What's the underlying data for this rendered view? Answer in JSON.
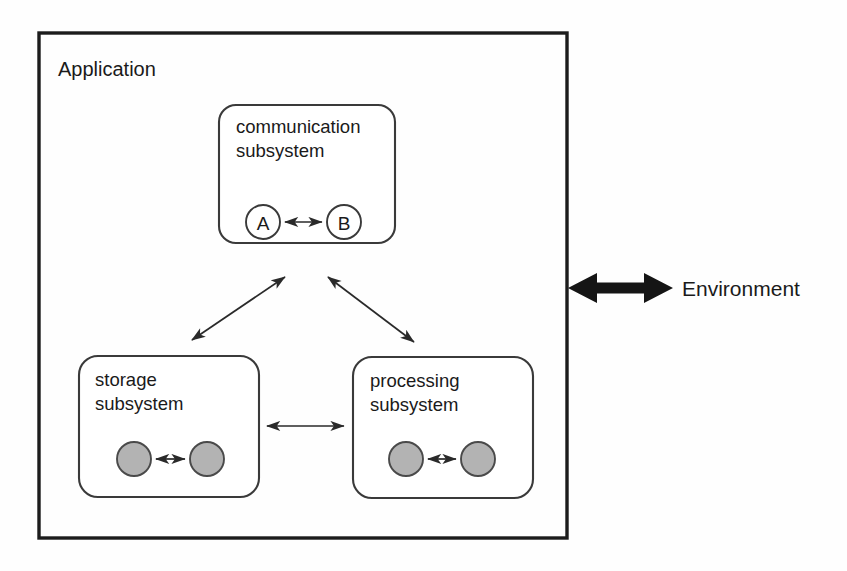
{
  "diagram": {
    "outer_container": {
      "label": "Application",
      "shape": "rectangle",
      "border_color": "#1c1c1c"
    },
    "external_label": "Environment",
    "external_connector": {
      "name": "environment-arrow",
      "style": "thick-double-headed",
      "color": "#151515"
    },
    "subsystems": [
      {
        "id": "communication",
        "label_line1": "communication",
        "label_line2": "subsystem",
        "nodes": [
          {
            "id": "node-a",
            "label": "A",
            "fill": "#ffffff"
          },
          {
            "id": "node-b",
            "label": "B",
            "fill": "#ffffff"
          }
        ],
        "internal_connector": "double-headed-arrow"
      },
      {
        "id": "storage",
        "label_line1": "storage",
        "label_line2": "subsystem",
        "nodes": [
          {
            "id": "storage-node-1",
            "label": "",
            "fill": "#b3b3b3"
          },
          {
            "id": "storage-node-2",
            "label": "",
            "fill": "#b3b3b3"
          }
        ],
        "internal_connector": "double-headed-arrow"
      },
      {
        "id": "processing",
        "label_line1": "processing",
        "label_line2": "subsystem",
        "nodes": [
          {
            "id": "processing-node-1",
            "label": "",
            "fill": "#b3b3b3"
          },
          {
            "id": "processing-node-2",
            "label": "",
            "fill": "#b3b3b3"
          }
        ],
        "internal_connector": "double-headed-arrow"
      }
    ],
    "connectors": [
      {
        "id": "comm-storage",
        "from": "communication",
        "to": "storage",
        "style": "double-headed-arrow"
      },
      {
        "id": "comm-processing",
        "from": "communication",
        "to": "processing",
        "style": "double-headed-arrow"
      },
      {
        "id": "storage-processing",
        "from": "storage",
        "to": "processing",
        "style": "double-headed-arrow"
      }
    ],
    "colors": {
      "background": "#fefefe",
      "stroke": "#1c1c1c",
      "node_fill_gray": "#b3b3b3",
      "node_fill_white": "#ffffff"
    }
  }
}
